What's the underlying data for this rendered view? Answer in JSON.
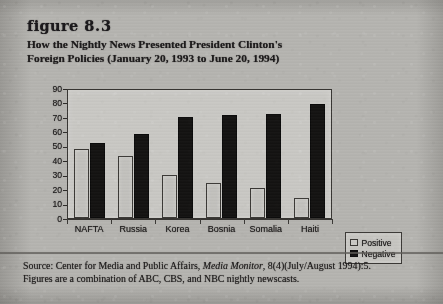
{
  "figure": {
    "label_word": "figure",
    "label_number": "8.3",
    "title_line1": "How the Nightly News Presented President Clinton's",
    "title_line2": "Foreign Policies (January 20, 1993 to June 20, 1994)"
  },
  "legend": {
    "entries": [
      {
        "label": "Positive",
        "swatch": "light-square-swatch",
        "color": "#cac9c5"
      },
      {
        "label": "Negative",
        "swatch": "black-square-swatch",
        "color": "#121111"
      }
    ]
  },
  "source": {
    "line1_pre": "Source: Center for Media and Public Affairs, ",
    "line1_italic": "Media Monitor",
    "line1_post": ", 8(4)(July/August 1994):5.",
    "line2": "Figures are a combination of ABC, CBS, and NBC nightly newscasts."
  },
  "chart_data": {
    "type": "bar",
    "title": "How the Nightly News Presented President Clinton's Foreign Policies (January 20, 1993 to June 20, 1994)",
    "xlabel": "",
    "ylabel": "",
    "categories": [
      "NAFTA",
      "Russia",
      "Korea",
      "Bosnia",
      "Somalia",
      "Haiti"
    ],
    "series": [
      {
        "name": "Positive",
        "color": "#cac9c5",
        "values": [
          48,
          43,
          30,
          24,
          21,
          14
        ]
      },
      {
        "name": "Negative",
        "color": "#121111",
        "values": [
          52,
          58,
          70,
          71,
          72,
          79
        ]
      }
    ],
    "ylim": [
      0,
      90
    ],
    "ytick_labels": [
      "90",
      "80",
      "70",
      "60",
      "50",
      "40",
      "30",
      "20",
      "10",
      "0"
    ],
    "ytick_values": [
      90,
      80,
      70,
      60,
      50,
      40,
      30,
      20,
      10,
      0
    ],
    "ytick_step": 10,
    "grid": false,
    "legend_position": "right"
  }
}
